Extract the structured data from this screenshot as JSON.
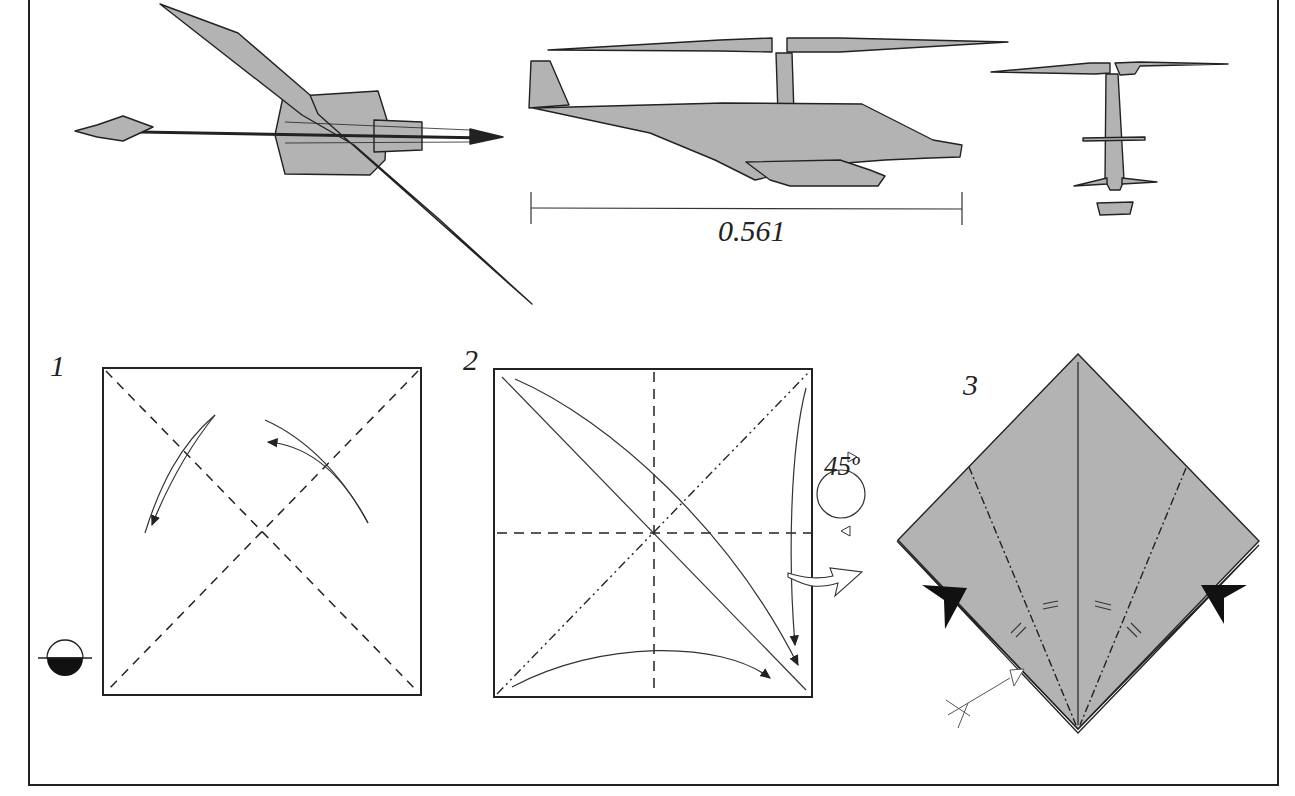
{
  "diagram": {
    "colors": {
      "paper": "#b3b3b3",
      "line": "#222222",
      "background": "#ffffff"
    },
    "model_views": [
      {
        "id": "top-view",
        "label": ""
      },
      {
        "id": "side-view",
        "label": ""
      },
      {
        "id": "front-view",
        "label": ""
      }
    ],
    "scale_bar": {
      "value": "0.561"
    },
    "steps": [
      {
        "number": "1",
        "description": "Valley fold diagonals, unfold",
        "symbols": [
          "colored-side-down-icon"
        ]
      },
      {
        "number": "2",
        "description": "Squash fold corners; rotate model",
        "rotation": "45º"
      },
      {
        "number": "3",
        "description": "Fold edges to center crease; inside reverse folds",
        "symbols": [
          "push-arrow-icon",
          "equal-distance-icon"
        ]
      }
    ]
  }
}
